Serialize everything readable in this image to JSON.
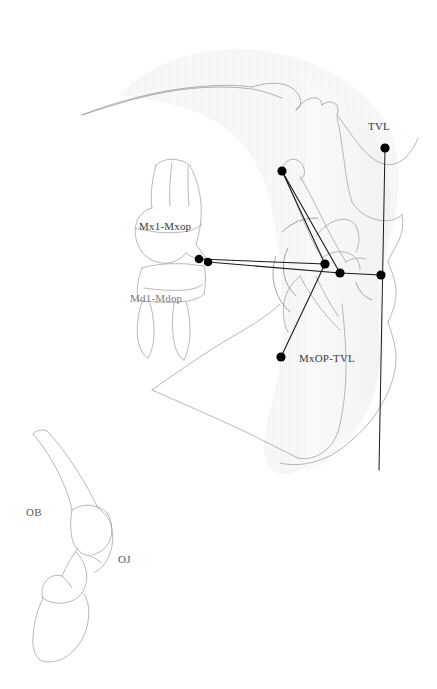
{
  "figure": {
    "kind": "cephalometric-tracing",
    "width": 437,
    "height": 689,
    "background": "#ffffff",
    "outline_color": "#8c8c8c",
    "shadow_color": "#f4f4f4",
    "measurement_color": "#1a1a1a",
    "point_color": "#000000",
    "label_color": "#3a3a3a"
  },
  "labels": {
    "tvl": "TVL",
    "mx1_mxop": "Mx1-Mxop",
    "md1_mdop": "Md1-Mdop",
    "mxop_tvl": "MxOP-TVL",
    "ob": "OB",
    "oj": "OJ"
  },
  "label_positions": {
    "tvl": {
      "x": 368,
      "y": 120
    },
    "mx1_mxop": {
      "x": 139,
      "y": 220
    },
    "md1_mdop": {
      "x": 130,
      "y": 292
    },
    "mxop_tvl": {
      "x": 299,
      "y": 352
    },
    "ob": {
      "x": 26,
      "y": 506
    },
    "oj": {
      "x": 118,
      "y": 553
    }
  },
  "landmarks": [
    {
      "name": "mx1-incisal-edge",
      "x": 199,
      "y": 259
    },
    {
      "name": "md1-incisal-edge",
      "x": 208,
      "y": 262
    },
    {
      "name": "mxop-posterior",
      "x": 325,
      "y": 264
    },
    {
      "name": "mdop-posterior",
      "x": 340,
      "y": 273
    },
    {
      "name": "condyle-superior",
      "x": 282,
      "y": 171
    },
    {
      "name": "gonion-inferior",
      "x": 281,
      "y": 357
    },
    {
      "name": "tvl-superior",
      "x": 385,
      "y": 148
    },
    {
      "name": "tvl-occlusal-intersect",
      "x": 381,
      "y": 275
    }
  ],
  "measurement_lines": [
    {
      "name": "mx1-mxop-line",
      "x1": 199,
      "y1": 259,
      "x2": 325,
      "y2": 264
    },
    {
      "name": "md1-mdop-line",
      "x1": 208,
      "y1": 262,
      "x2": 340,
      "y2": 273
    },
    {
      "name": "mxop-tvl-line",
      "x1": 281,
      "y1": 357,
      "x2": 325,
      "y2": 264
    },
    {
      "name": "condyle-to-mdop-line",
      "x1": 282,
      "y1": 171,
      "x2": 340,
      "y2": 273
    },
    {
      "name": "condyle-to-mxop-line",
      "x1": 282,
      "y1": 171,
      "x2": 325,
      "y2": 264
    },
    {
      "name": "occlusal-extension-line",
      "x1": 340,
      "y1": 273,
      "x2": 381,
      "y2": 275
    },
    {
      "name": "tvl-vertical-line",
      "x1": 385,
      "y1": 148,
      "x2": 379,
      "y2": 470
    }
  ],
  "angle_arcs": [
    {
      "name": "mxop-tvl-arc",
      "cx": 325,
      "cy": 264,
      "r": 38
    },
    {
      "name": "tvl-occlusal-arc",
      "cx": 381,
      "cy": 275,
      "r": 26
    },
    {
      "name": "posterior-arc",
      "cx": 325,
      "cy": 264,
      "r": 52
    }
  ]
}
